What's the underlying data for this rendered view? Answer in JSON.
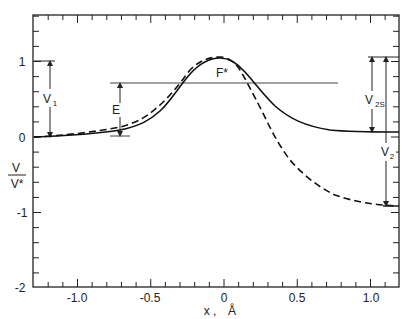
{
  "chart_data": {
    "type": "line",
    "title": "",
    "xlabel": "x , Å",
    "ylabel": "V / V*",
    "xlim": [
      -1.3,
      1.2
    ],
    "ylim": [
      -2,
      1.6
    ],
    "x_ticks": [
      "-1.0",
      "-0.5",
      "0",
      "0.5",
      "1.0"
    ],
    "y_ticks": [
      "1",
      "0",
      "-1",
      "-2"
    ],
    "grid": false,
    "series": [
      {
        "name": "symmetric-like potential (solid)",
        "style": "solid",
        "x": [
          -1.3,
          -1.0,
          -0.71,
          -0.57,
          -0.44,
          -0.31,
          -0.2,
          -0.1,
          -0.03,
          0.05,
          0.14,
          0.26,
          0.38,
          0.52,
          0.72,
          0.93,
          1.19
        ],
        "y": [
          0.0,
          0.03,
          0.09,
          0.15,
          0.34,
          0.66,
          0.91,
          1.03,
          1.04,
          1.01,
          0.86,
          0.58,
          0.34,
          0.19,
          0.09,
          0.07,
          0.07
        ]
      },
      {
        "name": "exothermic potential (dashed)",
        "style": "dashed",
        "x": [
          -1.3,
          -1.0,
          -0.71,
          -0.57,
          -0.44,
          -0.31,
          -0.2,
          -0.1,
          -0.03,
          0.05,
          0.11,
          0.18,
          0.26,
          0.35,
          0.45,
          0.59,
          0.76,
          0.93,
          1.1,
          1.19
        ],
        "y": [
          0.0,
          0.04,
          0.13,
          0.23,
          0.41,
          0.68,
          0.94,
          1.05,
          1.06,
          1.01,
          0.89,
          0.65,
          0.34,
          -0.01,
          -0.3,
          -0.57,
          -0.77,
          -0.86,
          -0.9,
          -0.91
        ]
      }
    ],
    "annotations": [
      {
        "text": "F*",
        "x": 0.0,
        "y": 0.95,
        "note": "transition state at barrier top"
      },
      {
        "text": "E",
        "type": "horizontal-line",
        "y": 0.72,
        "x_range": [
          -0.78,
          0.78
        ],
        "note": "energy level with arrow from reactant baseline"
      },
      {
        "text": "V1",
        "type": "double-arrow",
        "x": -1.18,
        "y_range": [
          0,
          1
        ]
      },
      {
        "text": "V2S",
        "type": "double-arrow",
        "x": 1.0,
        "y_range": [
          0.07,
          1
        ]
      },
      {
        "text": "V2",
        "type": "double-arrow",
        "x": 1.1,
        "y_range": [
          -0.91,
          1
        ]
      }
    ]
  },
  "axes": {
    "xlabel_main": "x ,",
    "xlabel_unit": "Å",
    "ylabel_num": "V",
    "ylabel_den": "V*",
    "x_tick_labels": [
      "-1.0",
      "-0.5",
      "0",
      "0.5",
      "1.0"
    ],
    "y_tick_labels": [
      "1",
      "0",
      "-1",
      "-2"
    ]
  },
  "annotations": {
    "fstar": "F*",
    "e": "E",
    "v1": "V",
    "v1_sub": "1",
    "v2s": "V",
    "v2s_sub": "2S",
    "v2": "V",
    "v2_sub": "2"
  }
}
